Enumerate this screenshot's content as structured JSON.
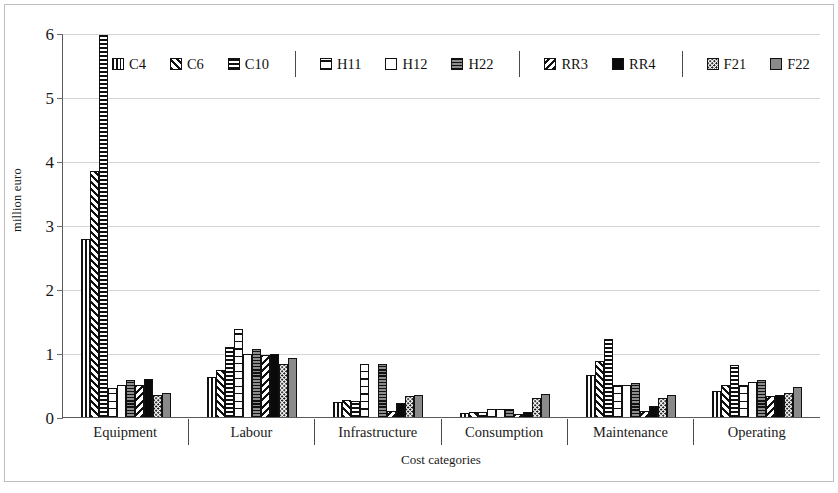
{
  "chart_data": {
    "type": "bar",
    "title": "",
    "xlabel": "Cost categories",
    "ylabel": "million euro",
    "ylim": [
      0,
      6
    ],
    "yticks": [
      0,
      1,
      2,
      3,
      4,
      5,
      6
    ],
    "grid": true,
    "legend_position": "inside-top",
    "legend_groups": [
      [
        "C4",
        "C6",
        "C10"
      ],
      [
        "H11",
        "H12",
        "H22"
      ],
      [
        "RR3",
        "RR4"
      ],
      [
        "F21",
        "F22"
      ]
    ],
    "categories": [
      "Equipment",
      "Labour",
      "Infrastructure",
      "Consumption",
      "Maintenance",
      "Operating"
    ],
    "series": [
      {
        "name": "C4",
        "pattern": "vertical-stripes",
        "values": [
          2.78,
          0.63,
          0.24,
          0.07,
          0.65,
          0.4
        ]
      },
      {
        "name": "C6",
        "pattern": "diagonal-up-stripes",
        "values": [
          3.85,
          0.74,
          0.26,
          0.08,
          0.88,
          0.5
        ]
      },
      {
        "name": "C10",
        "pattern": "horizontal-stripes",
        "values": [
          5.97,
          1.09,
          0.25,
          0.08,
          1.22,
          0.81
        ]
      },
      {
        "name": "H11",
        "pattern": "horizontal-bands",
        "values": [
          0.45,
          1.37,
          0.83,
          0.13,
          0.5,
          0.5
        ]
      },
      {
        "name": "H12",
        "pattern": "white",
        "values": [
          0.5,
          0.98,
          0.0,
          0.13,
          0.5,
          0.55
        ]
      },
      {
        "name": "H22",
        "pattern": "dense-horizontal-stripes",
        "values": [
          0.58,
          1.06,
          0.83,
          0.12,
          0.53,
          0.58
        ]
      },
      {
        "name": "RR3",
        "pattern": "diagonal-down-stripes",
        "values": [
          0.5,
          0.97,
          0.1,
          0.05,
          0.1,
          0.33
        ]
      },
      {
        "name": "RR4",
        "pattern": "solid-black",
        "values": [
          0.6,
          0.99,
          0.22,
          0.08,
          0.17,
          0.35
        ]
      },
      {
        "name": "F21",
        "pattern": "dotted",
        "values": [
          0.35,
          0.83,
          0.33,
          0.3,
          0.3,
          0.37
        ]
      },
      {
        "name": "F22",
        "pattern": "solid-grey",
        "values": [
          0.38,
          0.92,
          0.35,
          0.36,
          0.35,
          0.47
        ]
      }
    ]
  },
  "axes": {
    "y_title": "million euro",
    "x_title": "Cost categories",
    "y_tick_labels": [
      "0",
      "1",
      "2",
      "3",
      "4",
      "5",
      "6"
    ],
    "x_tick_labels": [
      "Equipment",
      "Labour",
      "Infrastructure",
      "Consumption",
      "Maintenance",
      "Operating"
    ]
  },
  "legend": {
    "items": [
      {
        "label": "C4",
        "swatch": "vertical-stripes"
      },
      {
        "label": "C6",
        "swatch": "diagonal-up-stripes"
      },
      {
        "label": "C10",
        "swatch": "horizontal-stripes"
      },
      {
        "label": "H11",
        "swatch": "horizontal-bands"
      },
      {
        "label": "H12",
        "swatch": "white"
      },
      {
        "label": "H22",
        "swatch": "dense-horizontal-stripes"
      },
      {
        "label": "RR3",
        "swatch": "diagonal-down-stripes"
      },
      {
        "label": "RR4",
        "swatch": "solid-black"
      },
      {
        "label": "F21",
        "swatch": "dotted"
      },
      {
        "label": "F22",
        "swatch": "solid-grey"
      }
    ],
    "divider_after": [
      2,
      5,
      7
    ]
  },
  "colors": {
    "grid": "#d4d4d4",
    "axis": "#5a5a5a",
    "bar_outline": "#111111",
    "grey_fill": "#8a8a8a",
    "black_fill": "#0a0a0a",
    "background": "#ffffff"
  }
}
